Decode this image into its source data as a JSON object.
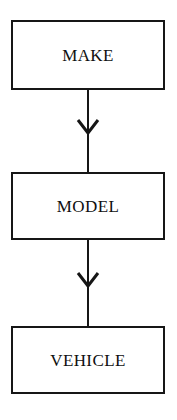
{
  "diagram": {
    "type": "flowchart",
    "orientation": "vertical",
    "background_color": "#ffffff",
    "stroke_color": "#161616",
    "text_color": "#101010",
    "nodes": [
      {
        "id": "make",
        "label": "MAKE"
      },
      {
        "id": "model",
        "label": "MODEL"
      },
      {
        "id": "vehicle",
        "label": "VEHICLE"
      }
    ],
    "edges": [
      {
        "from": "MAKE",
        "to": "MODEL",
        "arrowhead": "open-chevron"
      },
      {
        "from": "MODEL",
        "to": "VEHICLE",
        "arrowhead": "open-chevron"
      }
    ]
  }
}
